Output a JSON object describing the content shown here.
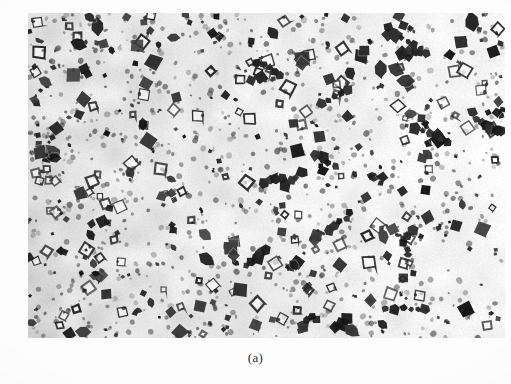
{
  "figure": {
    "caption": "(a)",
    "kind": "optical-micrograph",
    "plate": {
      "left": 28,
      "top": 13,
      "width": 477,
      "height": 325
    },
    "colors": {
      "page_background": "#fdfdfd",
      "matrix_light": "#f2f1ee",
      "matrix_mid": "#e3e2dd",
      "matrix_shadow": "#cfcec8",
      "particle_dark": "#1a1a1a",
      "particle_mid": "#3c3c3c",
      "particle_outline": "#2a2a2a",
      "caption_text": "#2e2e2e"
    },
    "rendering": {
      "type": "procedural-micrograph",
      "seed": 20240517,
      "grain_amount": 0.16,
      "background_gradient": {
        "description": "matrix is mottled grey-darker at left, brighter white toward right",
        "left_value": 221,
        "right_value": 250
      },
      "particle_counts": {
        "solid_blobs": 330,
        "outlined_cubes": 120,
        "fine_specks": 900
      },
      "particle_size_px": {
        "solid_min": 3,
        "solid_max": 16,
        "outlined_min": 5,
        "outlined_max": 13,
        "speck_min": 1,
        "speck_max": 3
      }
    }
  }
}
